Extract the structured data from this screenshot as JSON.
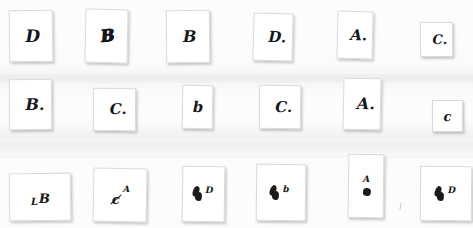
{
  "sheet": {
    "title": "Scanned handwritten answer slips",
    "background_color": "#fdfdfd",
    "slip_color": "#ffffff",
    "ink_color": "#15171a",
    "rows": 3,
    "columns": 6,
    "total_slips": 18
  },
  "slips": [
    {
      "id": "r1c1",
      "answer": "D",
      "row": 1,
      "col": 1,
      "x": 9,
      "y": 10,
      "w": 44,
      "h": 52,
      "rot": -0.8,
      "style": "plain",
      "sup": "",
      "font_size": 17
    },
    {
      "id": "r1c2",
      "answer": "B",
      "row": 1,
      "col": 2,
      "x": 85,
      "y": 9,
      "w": 43,
      "h": 54,
      "rot": 1.2,
      "style": "inked",
      "sup": "",
      "font_size": 16
    },
    {
      "id": "r1c3",
      "answer": "B",
      "row": 1,
      "col": 3,
      "x": 166,
      "y": 10,
      "w": 44,
      "h": 53,
      "rot": -0.6,
      "style": "plain",
      "sup": "",
      "font_size": 16
    },
    {
      "id": "r1c4",
      "answer": "D.",
      "row": 1,
      "col": 4,
      "x": 253,
      "y": 13,
      "w": 40,
      "h": 48,
      "rot": 1.6,
      "style": "plain",
      "sup": "",
      "font_size": 15
    },
    {
      "id": "r1c5",
      "answer": "A.",
      "row": 1,
      "col": 5,
      "x": 337,
      "y": 11,
      "w": 36,
      "h": 48,
      "rot": 1.4,
      "style": "plain",
      "sup": "",
      "font_size": 15
    },
    {
      "id": "r1c6",
      "answer": "C.",
      "row": 1,
      "col": 6,
      "x": 420,
      "y": 22,
      "w": 33,
      "h": 35,
      "rot": -0.4,
      "style": "plain",
      "sup": "",
      "font_size": 13
    },
    {
      "id": "r2c1",
      "answer": "B.",
      "row": 2,
      "col": 1,
      "x": 9,
      "y": 79,
      "w": 43,
      "h": 51,
      "rot": -0.5,
      "style": "plain",
      "sup": "",
      "font_size": 16
    },
    {
      "id": "r2c2",
      "answer": "C.",
      "row": 2,
      "col": 2,
      "x": 93,
      "y": 88,
      "w": 43,
      "h": 43,
      "rot": 0.4,
      "style": "plain",
      "sup": "",
      "font_size": 15
    },
    {
      "id": "r2c3",
      "answer": "b",
      "row": 2,
      "col": 3,
      "x": 182,
      "y": 85,
      "w": 31,
      "h": 44,
      "rot": 0.9,
      "style": "plain",
      "sup": "",
      "font_size": 15
    },
    {
      "id": "r2c4",
      "answer": "C.",
      "row": 2,
      "col": 4,
      "x": 259,
      "y": 85,
      "w": 42,
      "h": 44,
      "rot": 0.5,
      "style": "plain",
      "sup": "",
      "font_size": 15
    },
    {
      "id": "r2c5",
      "answer": "A.",
      "row": 2,
      "col": 5,
      "x": 343,
      "y": 78,
      "w": 38,
      "h": 52,
      "rot": 1.1,
      "style": "plain",
      "sup": "",
      "font_size": 16
    },
    {
      "id": "r2c6",
      "answer": "c",
      "row": 2,
      "col": 6,
      "x": 432,
      "y": 100,
      "w": 31,
      "h": 32,
      "rot": -0.3,
      "style": "plain",
      "sup": "",
      "font_size": 13
    },
    {
      "id": "r3c1",
      "answer": "B",
      "row": 3,
      "col": 1,
      "x": 9,
      "y": 173,
      "w": 62,
      "h": 48,
      "rot": -0.7,
      "style": "prefixed",
      "sup": "L",
      "font_size": 12
    },
    {
      "id": "r3c2",
      "answer": "A",
      "row": 3,
      "col": 2,
      "x": 93,
      "y": 168,
      "w": 54,
      "h": 54,
      "rot": 1.0,
      "style": "struck",
      "sup": "A",
      "font_size": 11
    },
    {
      "id": "r3c3",
      "answer": "D",
      "row": 3,
      "col": 3,
      "x": 182,
      "y": 166,
      "w": 43,
      "h": 56,
      "rot": 0.8,
      "style": "blotted",
      "sup": "D",
      "font_size": 11
    },
    {
      "id": "r3c4",
      "answer": "b",
      "row": 3,
      "col": 4,
      "x": 256,
      "y": 164,
      "w": 50,
      "h": 57,
      "rot": 0.6,
      "style": "blotted",
      "sup": "b",
      "font_size": 11
    },
    {
      "id": "r3c5",
      "answer": "A",
      "row": 3,
      "col": 5,
      "x": 348,
      "y": 154,
      "w": 36,
      "h": 64,
      "rot": 0.7,
      "style": "over-blot",
      "sup": "A",
      "font_size": 11
    },
    {
      "id": "r3c6",
      "answer": "D",
      "row": 3,
      "col": 6,
      "x": 420,
      "y": 166,
      "w": 52,
      "h": 55,
      "rot": 0.4,
      "style": "blotted",
      "sup": "D",
      "font_size": 11
    }
  ],
  "artifacts": {
    "faint_tick_label": "faint pencil tick",
    "tick_x": 400,
    "tick_y": 203
  }
}
